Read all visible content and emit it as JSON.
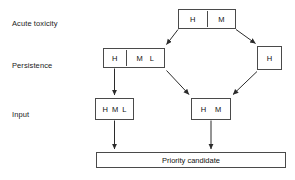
{
  "diagram": {
    "row_labels": [
      {
        "name": "acute-toxicity",
        "text": "Acute toxicity"
      },
      {
        "name": "persistence",
        "text": "Persistence"
      },
      {
        "name": "input",
        "text": "Input"
      }
    ],
    "nodes": {
      "top": {
        "cells": [
          "H",
          "M"
        ],
        "divider_after": 1
      },
      "left": {
        "cells": [
          "H",
          "M",
          "L"
        ],
        "divider_after": 1
      },
      "right": {
        "cells": [
          "H"
        ],
        "divider_after": 0
      },
      "bottom_left": {
        "cells": [
          "H",
          "M",
          "L"
        ],
        "divider_after": 0
      },
      "bottom_right": {
        "cells": [
          "H",
          "M"
        ],
        "divider_after": 0
      },
      "priority": {
        "label": "Priority candidate"
      }
    },
    "colors": {
      "box_border": "#4a4a4a",
      "arrow": "#2b2b2b",
      "text": "#111111",
      "background": "#ffffff"
    }
  }
}
